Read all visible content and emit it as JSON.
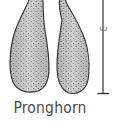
{
  "figure": {
    "caption": "Pronghorn",
    "scale_bar": {
      "label_partial": "3",
      "orientation": "vertical"
    },
    "colors": {
      "outline": "#2b2b2b",
      "fill": "#c9c9c9",
      "stipple": "#3a3a3a",
      "caption_text": "#4a4a4a",
      "scale_bar": "#333333"
    }
  }
}
